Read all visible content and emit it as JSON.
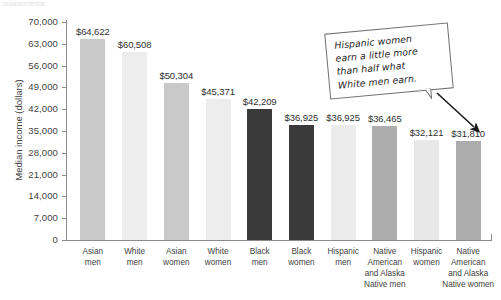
{
  "top_sliver": {
    "text": "supplemental"
  },
  "chart_data": {
    "type": "bar",
    "title": "",
    "xlabel": "",
    "ylabel": "Median income (dollars)",
    "ylim": [
      0,
      70000
    ],
    "ytick_labels": [
      "70,000",
      "63,000",
      "56,000",
      "49,000",
      "42,000",
      "35,000",
      "28,000",
      "21,000",
      "14,000",
      "7,000",
      "0"
    ],
    "ytick_values": [
      70000,
      63000,
      56000,
      49000,
      42000,
      35000,
      28000,
      21000,
      14000,
      7000,
      0
    ],
    "grid": false,
    "legend": "none",
    "categories": [
      "Asian men",
      "White men",
      "Asian women",
      "White women",
      "Black men",
      "Black women",
      "Hispanic men",
      "Native American and Alaska Native men",
      "Hispanic women",
      "Native American and Alaska Native women"
    ],
    "category_lines": [
      [
        "Asian",
        "men"
      ],
      [
        "White",
        "men"
      ],
      [
        "Asian",
        "women"
      ],
      [
        "White",
        "women"
      ],
      [
        "Black",
        "men"
      ],
      [
        "Black",
        "women"
      ],
      [
        "Hispanic",
        "men"
      ],
      [
        "Native",
        "American",
        "and Alaska",
        "Native men"
      ],
      [
        "Hispanic",
        "women"
      ],
      [
        "Native",
        "American",
        "and Alaska",
        "Native women"
      ]
    ],
    "values": [
      64622,
      60508,
      50304,
      45371,
      42209,
      36925,
      36925,
      36465,
      32121,
      31810
    ],
    "value_labels": [
      "$64,622",
      "$60,508",
      "$50,304",
      "$45,371",
      "$42,209",
      "$36,925",
      "$36,925",
      "$36,465",
      "$32,121",
      "$31,810"
    ],
    "bar_colors": [
      "#c9c9c9",
      "#ededed",
      "#c9c9c9",
      "#ededed",
      "#3a3a3a",
      "#3a3a3a",
      "#ececec",
      "#adadad",
      "#e8e8e8",
      "#adadad"
    ],
    "annotations": [
      {
        "name": "hispanic-women-callout",
        "lines": [
          "Hispanic women",
          "earn a little more",
          "than half  what",
          "White men earn."
        ],
        "points_to": "Native American and Alaska Native women"
      }
    ]
  },
  "colors": {
    "axis": "#8b8b8b",
    "text": "#3f3f3f",
    "callout_border": "#6f6f6f",
    "arrow": "#1a1a1a"
  }
}
